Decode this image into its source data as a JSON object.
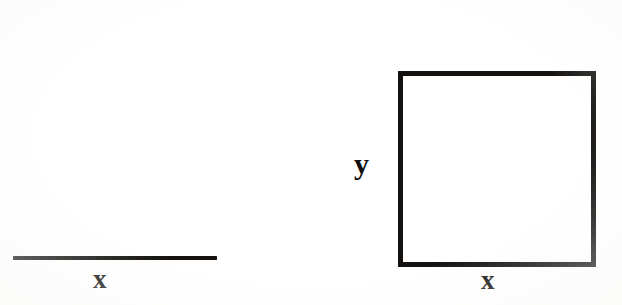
{
  "figure": {
    "caption_text": "",
    "background_color": "#ffffff",
    "ink_color": "#14110f",
    "width_px": 622,
    "height_px": 305
  },
  "left_figure": {
    "name": "line-segment",
    "shape": "horizontal line segment",
    "label": "x",
    "label_position": "below-center",
    "stroke_width_px": 4,
    "length_px": 204,
    "geometry": {
      "x1": 13,
      "y1": 258,
      "x2": 217,
      "y2": 258
    }
  },
  "right_figure": {
    "name": "square",
    "shape": "square outline",
    "labels": {
      "bottom": "x",
      "left": "y"
    },
    "stroke_width_px": 5,
    "geometry": {
      "left": 398,
      "top": 71,
      "width": 188,
      "height": 186
    }
  },
  "labels": {
    "segment_x": "x",
    "square_x": "x",
    "square_y": "y"
  }
}
